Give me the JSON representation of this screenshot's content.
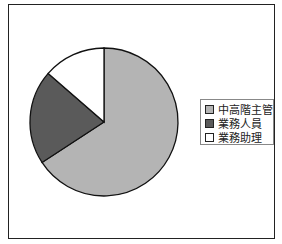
{
  "chart_data": {
    "type": "pie",
    "title": "",
    "categories": [
      "中高階主管",
      "業務人員",
      "業務助理"
    ],
    "values": [
      65.8,
      20.6,
      13.6
    ],
    "colors": [
      "#b4b4b4",
      "#5a5a5a",
      "#ffffff"
    ],
    "start_angle_deg": 0,
    "direction": "clockwise",
    "legend_position": "right"
  },
  "legend": {
    "items": [
      {
        "label": "中高階主管",
        "color": "#b4b4b4"
      },
      {
        "label": "業務人員",
        "color": "#5a5a5a"
      },
      {
        "label": "業務助理",
        "color": "#ffffff"
      }
    ]
  }
}
